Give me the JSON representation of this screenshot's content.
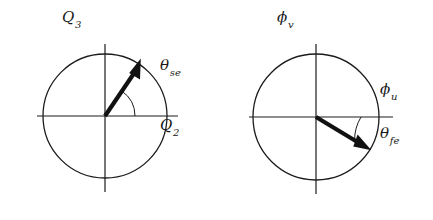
{
  "figure": {
    "background_color": "#ffffff",
    "line_color": "#1c1c1c",
    "vector_color": "#111111",
    "width": 433,
    "height": 220
  },
  "diagrams": [
    {
      "name": "left-phasor-diagram",
      "center": {
        "x": 105,
        "y": 116
      },
      "radius": 62,
      "vector": {
        "name": "theta-se-vector",
        "angle_deg": 56,
        "length": 62,
        "direction": "up-right"
      },
      "angle_arc": {
        "name": "theta-se-arc",
        "radius": 30,
        "from_deg": 0,
        "to_deg": 56
      },
      "labels": {
        "vertical_axis": {
          "base": "Q",
          "sub": "3",
          "text": "Q3"
        },
        "horizontal_axis": {
          "base": "Q",
          "sub": "2",
          "text": "Q2"
        },
        "angle": {
          "base": "θ",
          "sub": "se",
          "text": "θse"
        }
      }
    },
    {
      "name": "right-phasor-diagram",
      "center": {
        "x": 316,
        "y": 117
      },
      "radius": 63,
      "vector": {
        "name": "theta-fe-vector",
        "angle_deg": -31,
        "length": 62,
        "direction": "down-right"
      },
      "angle_arc": {
        "name": "theta-fe-arc",
        "radius": 45,
        "from_deg": 0,
        "to_deg": -31
      },
      "labels": {
        "vertical_axis": {
          "base": "ϕ",
          "sub": "v",
          "text": "ϕv"
        },
        "horizontal_axis": {
          "base": "ϕ",
          "sub": "u",
          "text": "ϕu"
        },
        "angle": {
          "base": "θ",
          "sub": "fe",
          "text": "θfe"
        }
      }
    }
  ]
}
